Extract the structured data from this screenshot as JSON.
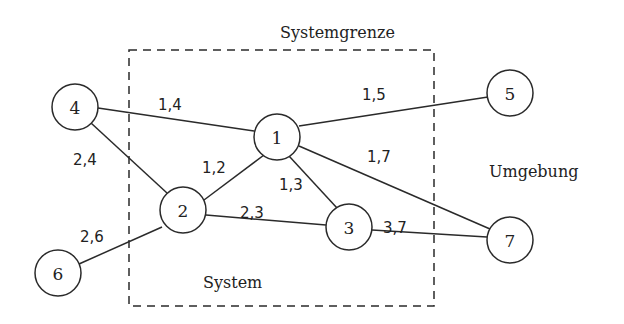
{
  "labels": {
    "boundary": "Systemgrenze",
    "system": "System",
    "environment": "Umgebung"
  },
  "nodes": [
    {
      "id": "1",
      "x": 277,
      "y": 137
    },
    {
      "id": "2",
      "x": 183,
      "y": 210
    },
    {
      "id": "3",
      "x": 349,
      "y": 227
    },
    {
      "id": "4",
      "x": 75,
      "y": 107
    },
    {
      "id": "5",
      "x": 510,
      "y": 93
    },
    {
      "id": "6",
      "x": 58,
      "y": 273
    },
    {
      "id": "7",
      "x": 510,
      "y": 240
    }
  ],
  "edges": [
    {
      "label": "1,4",
      "from": "1",
      "to": "4"
    },
    {
      "label": "1,5",
      "from": "1",
      "to": "5"
    },
    {
      "label": "1,2",
      "from": "1",
      "to": "2"
    },
    {
      "label": "1,3",
      "from": "1",
      "to": "3"
    },
    {
      "label": "1,7",
      "from": "1",
      "to": "7"
    },
    {
      "label": "2,4",
      "from": "2",
      "to": "4"
    },
    {
      "label": "2,3",
      "from": "2",
      "to": "3"
    },
    {
      "label": "2,6",
      "from": "2",
      "to": "6"
    },
    {
      "label": "3,7",
      "from": "3",
      "to": "7"
    }
  ]
}
